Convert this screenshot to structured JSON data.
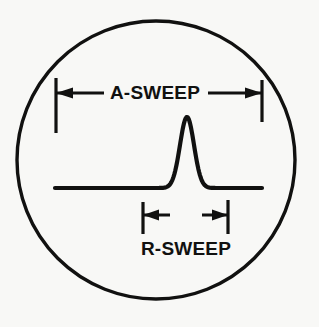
{
  "figure": {
    "background_color": "#f8f8f6",
    "ink_color": "#111110"
  },
  "scope": {
    "name": "crt-scope-face",
    "shape": "circle",
    "center_x": 156,
    "center_y": 160,
    "radius": 139,
    "stroke_width": 3.4
  },
  "trace": {
    "name": "oscilloscope-trace",
    "baseline_y": 188,
    "start_x": 55,
    "end_x": 262,
    "stroke_width": 4.2,
    "peak": {
      "label": "target-return-pulse",
      "apex_x": 187,
      "apex_y": 117,
      "height": 71,
      "half_width": 14
    }
  },
  "dimensions": [
    {
      "id": "a-sweep",
      "label": "A-SWEEP",
      "label_x": 155,
      "label_y": 93,
      "arrow_y": 93,
      "left_x": 56,
      "right_x": 262,
      "ext_left_top": 78,
      "ext_left_bottom": 133,
      "ext_right_top": 80,
      "ext_right_bottom": 122,
      "arrow_direction": "outward",
      "gap_half_width": 52
    },
    {
      "id": "r-sweep",
      "label": "R-SWEEP",
      "label_x": 186,
      "label_y": 249,
      "arrow_y": 215,
      "left_x": 143,
      "right_x": 228,
      "ext_left_top": 202,
      "ext_left_bottom": 234,
      "ext_right_top": 200,
      "ext_right_bottom": 234,
      "arrow_direction": "outward",
      "gap_half_width": 16
    }
  ],
  "labels": {
    "a_sweep": "A-SWEEP",
    "r_sweep": "R-SWEEP"
  }
}
